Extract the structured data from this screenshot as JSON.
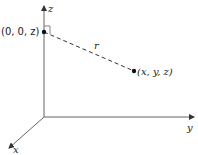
{
  "diagram": {
    "type": "3d-coordinate-axes",
    "axes": {
      "z_label": "z",
      "y_label": "y",
      "x_label": "x"
    },
    "points": {
      "axis_point_label": "(0, 0, z)",
      "general_point_label": "(x, y, z)"
    },
    "segment_label": "r",
    "colors": {
      "line": "#555555",
      "text": "#222222",
      "background": "#ffffff"
    }
  }
}
